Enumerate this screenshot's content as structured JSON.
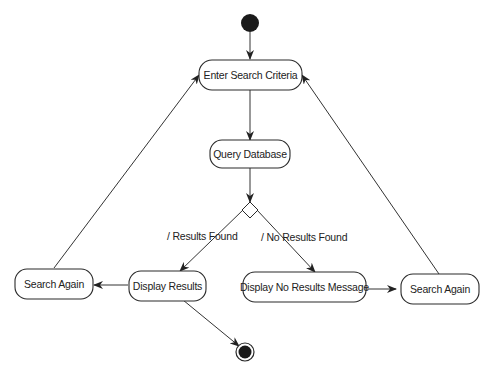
{
  "diagram": {
    "type": "UML activity diagram",
    "nodes": {
      "start": {
        "kind": "initial"
      },
      "enter": {
        "label": "Enter Search Criteria"
      },
      "query": {
        "label": "Query Database"
      },
      "decision": {
        "kind": "decision"
      },
      "display": {
        "label": "Display Results"
      },
      "search_left": {
        "label": "Search Again"
      },
      "no_results": {
        "label": "Display No Results Message"
      },
      "search_right": {
        "label": "Search Again"
      },
      "end": {
        "kind": "final"
      }
    },
    "guards": {
      "found": "/ Results Found",
      "not_found": "/ No Results Found"
    },
    "edges": [
      [
        "start",
        "enter"
      ],
      [
        "enter",
        "query"
      ],
      [
        "query",
        "decision"
      ],
      [
        "decision",
        "display"
      ],
      [
        "decision",
        "no_results"
      ],
      [
        "display",
        "search_left"
      ],
      [
        "display",
        "end"
      ],
      [
        "search_left",
        "enter"
      ],
      [
        "no_results",
        "search_right"
      ],
      [
        "search_right",
        "enter"
      ]
    ]
  }
}
